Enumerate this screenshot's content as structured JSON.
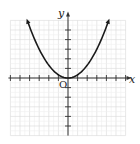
{
  "chart_data": {
    "type": "line",
    "title": "",
    "xlabel": "x",
    "ylabel": "y",
    "origin_label": "O",
    "function": "y = x^2/3",
    "xlim": [
      -6,
      6
    ],
    "ylim": [
      -6,
      6
    ],
    "x_ticks": [
      -6,
      -5,
      -4,
      -3,
      -2,
      -1,
      1,
      2,
      3,
      4,
      5,
      6
    ],
    "y_ticks": [
      -5,
      -4,
      -3,
      -2,
      -1,
      1,
      2,
      3,
      4,
      5
    ],
    "grid": true,
    "series": [
      {
        "name": "parabola",
        "x": [
          -4.2,
          -3,
          -2,
          -1,
          0,
          1,
          2,
          3,
          4.2
        ],
        "y": [
          5.88,
          3,
          1.33,
          0.33,
          0,
          0.33,
          1.33,
          3,
          5.88
        ]
      }
    ],
    "vertex": [
      0,
      0
    ],
    "arrows": "both ends of curve",
    "colors": {
      "curve": "#1a1a1a",
      "axis": "#333333",
      "grid": "#d9d9d9"
    }
  }
}
